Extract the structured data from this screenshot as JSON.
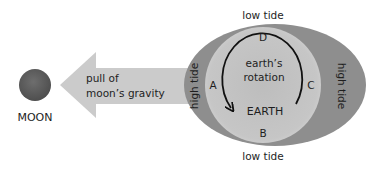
{
  "diagram": {
    "moon": {
      "label": "MOON",
      "color": "#5f5f5f"
    },
    "gravity_arrow": {
      "line1": "pull of",
      "line2": "moon’s gravity",
      "color": "#c9c9c9"
    },
    "earth": {
      "label": "EARTH",
      "color": "#c4c4c4",
      "rotation_line1": "earth’s",
      "rotation_line2": "rotation"
    },
    "tidal_bulge": {
      "color": "#8d8d8d"
    },
    "points": {
      "A": "A",
      "B": "B",
      "C": "C",
      "D": "D"
    },
    "tides": {
      "top": "low tide",
      "bottom": "low tide",
      "left": "high tide",
      "right": "high tide"
    }
  }
}
